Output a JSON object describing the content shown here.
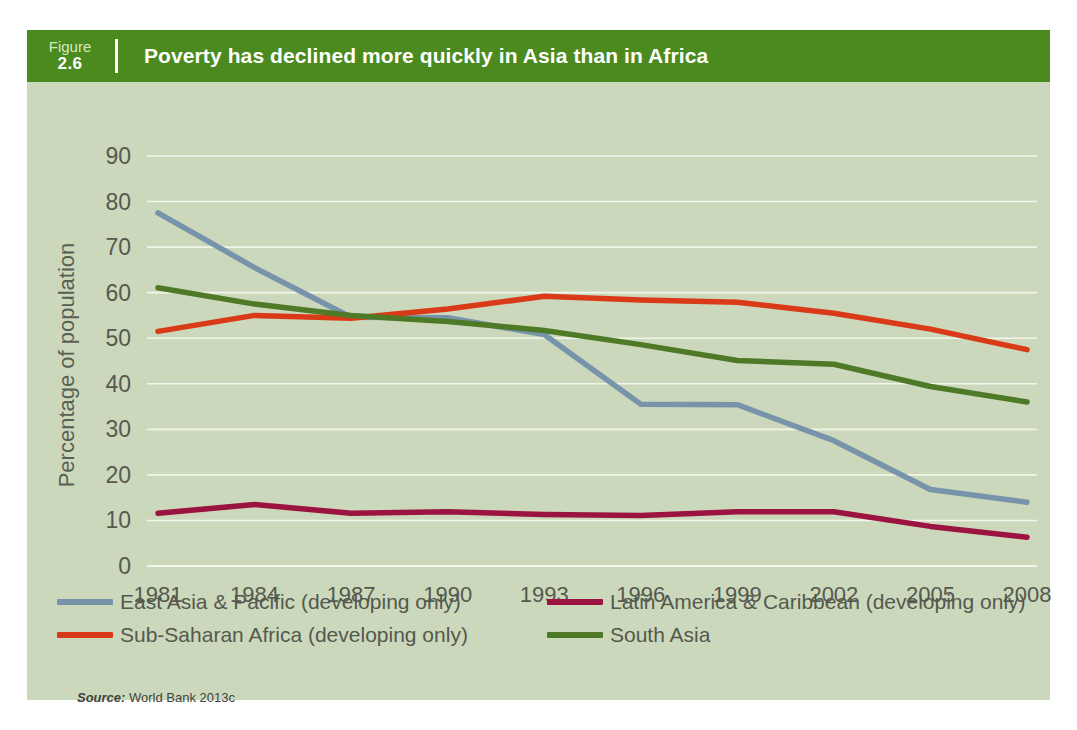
{
  "figure": {
    "label": "Figure",
    "number": "2.6",
    "title": "Poverty has declined more quickly in Asia than in Africa",
    "source_word": "Source:",
    "source_text": " World Bank 2013c"
  },
  "colors": {
    "header_green": "#4a8a1e",
    "panel_background": "#ccd8bc",
    "gridline": "#f2f6ea",
    "east_asia": "#7794ab",
    "sub_saharan_africa": "#d93b18",
    "latin_america": "#9b1340",
    "south_asia": "#4e7a28",
    "axis_text": "#55594f"
  },
  "chart_data": {
    "type": "line",
    "title": "Poverty has declined more quickly in Asia than in Africa",
    "xlabel": "",
    "ylabel": "Percentage of population",
    "ylim": [
      0,
      90
    ],
    "yticks": [
      0,
      10,
      20,
      30,
      40,
      50,
      60,
      70,
      80,
      90
    ],
    "grid": true,
    "legend_position": "bottom",
    "categories": [
      "1981",
      "1984",
      "1987",
      "1990",
      "1993",
      "1996",
      "1999",
      "2002",
      "2005",
      "2008"
    ],
    "x": [
      1981,
      1984,
      1987,
      1990,
      1993,
      1996,
      1999,
      2002,
      2005,
      2008
    ],
    "series": [
      {
        "name": "East Asia & Pacific (developing only)",
        "color": "#7794ab",
        "values": [
          77.5,
          65.5,
          54.6,
          54.5,
          50.8,
          35.5,
          35.4,
          27.5,
          16.8,
          14.0
        ]
      },
      {
        "name": "Sub-Saharan Africa (developing only)",
        "color": "#d93b18",
        "values": [
          51.5,
          55.0,
          54.4,
          56.4,
          59.2,
          58.4,
          57.9,
          55.5,
          52.0,
          47.5
        ]
      },
      {
        "name": "Latin America & Caribbean (developing only)",
        "color": "#9b1340",
        "values": [
          11.6,
          13.5,
          11.6,
          11.9,
          11.3,
          11.1,
          11.9,
          11.9,
          8.7,
          6.3
        ]
      },
      {
        "name": "South Asia",
        "color": "#4e7a28",
        "values": [
          61.1,
          57.5,
          55.0,
          53.7,
          51.7,
          48.6,
          45.1,
          44.3,
          39.4,
          36.0
        ]
      }
    ]
  },
  "legend": {
    "rows": [
      [
        {
          "label": "East Asia & Pacific (developing only)",
          "color": "#7794ab"
        },
        {
          "label": "Latin America & Caribbean (developing only)",
          "color": "#9b1340"
        }
      ],
      [
        {
          "label": "Sub-Saharan Africa (developing only)",
          "color": "#d93b18"
        },
        {
          "label": "South Asia",
          "color": "#4e7a28"
        }
      ]
    ]
  }
}
